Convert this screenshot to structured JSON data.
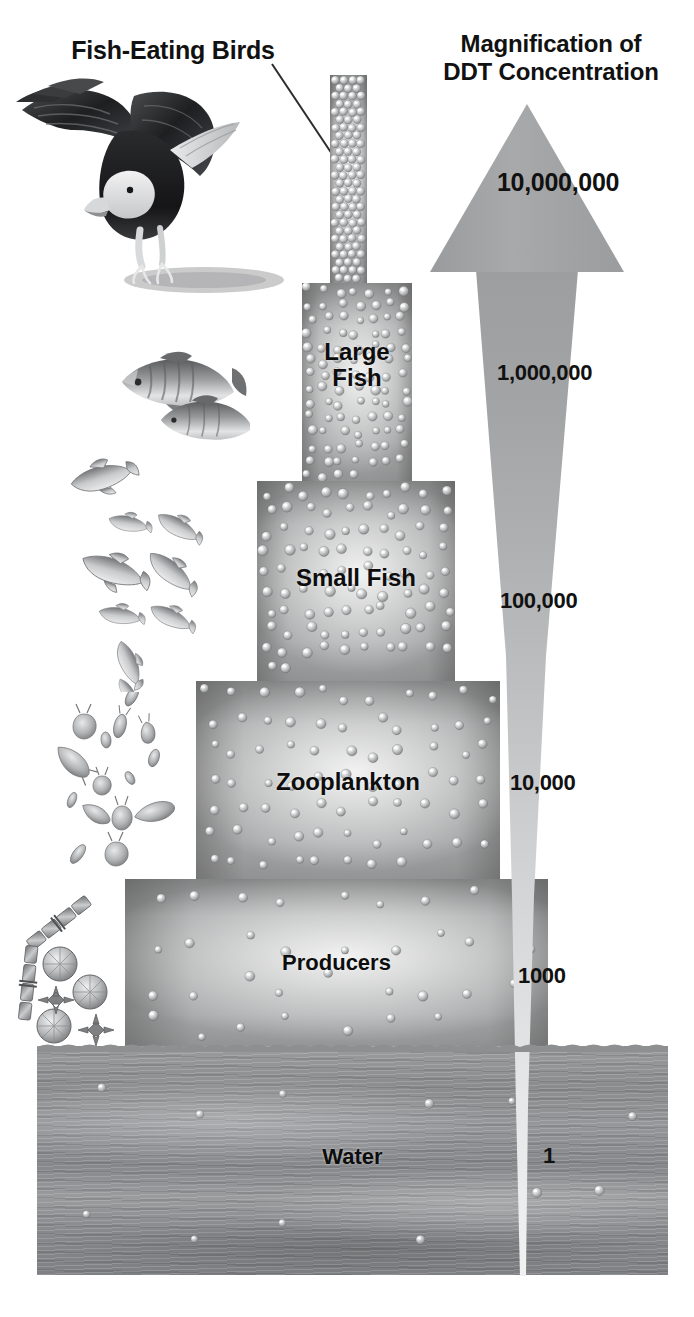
{
  "figure": {
    "type": "diagram",
    "bird_label": "Fish-Eating Birds",
    "magnification_title_line1": "Magnification of",
    "magnification_title_line2": "DDT Concentration"
  },
  "levels": [
    {
      "id": "fish-eating-birds",
      "label": "Fish-Eating Birds",
      "label_in_bar": "",
      "magnification": "10,000,000"
    },
    {
      "id": "large-fish",
      "label": "Large Fish",
      "line1": "Large",
      "line2": "Fish",
      "magnification": "1,000,000"
    },
    {
      "id": "small-fish",
      "label": "Small Fish",
      "magnification": "100,000"
    },
    {
      "id": "zooplankton",
      "label": "Zooplankton",
      "magnification": "10,000"
    },
    {
      "id": "producers",
      "label": "Producers",
      "magnification": "1000"
    },
    {
      "id": "water",
      "label": "Water",
      "magnification": "1"
    }
  ],
  "chart_data": {
    "type": "bar",
    "title": "Magnification of DDT Concentration",
    "categories": [
      "Water",
      "Producers",
      "Zooplankton",
      "Small Fish",
      "Large Fish",
      "Fish-Eating Birds"
    ],
    "values": [
      1,
      1000,
      10000,
      100000,
      1000000,
      10000000
    ],
    "value_labels": [
      "1",
      "1000",
      "10,000",
      "100,000",
      "1,000,000",
      "10,000,000"
    ],
    "xlabel": "",
    "ylabel": "Magnification of DDT Concentration",
    "scale": "logarithmic",
    "grid": false,
    "legend": "none",
    "note": "Bar width narrows with each higher trophic level while DDT concentration increases tenfold to a hundredfold per step"
  },
  "colors": {
    "bar_gray": "#a9aaab",
    "water_gray": "#8e8f90",
    "arrow_gray": "#a3a4a5",
    "text_black": "#0d0d0d",
    "background": "#ffffff"
  },
  "icons": {
    "eagle": "eagle-illustration",
    "large_fish": "large-fish-illustration",
    "small_fish": "small-fish-school-illustration",
    "zooplankton": "zooplankton-illustration",
    "phytoplankton": "phytoplankton-diatom-illustration",
    "arrow": "upward-tapering-arrow",
    "leader": "leader-line"
  }
}
